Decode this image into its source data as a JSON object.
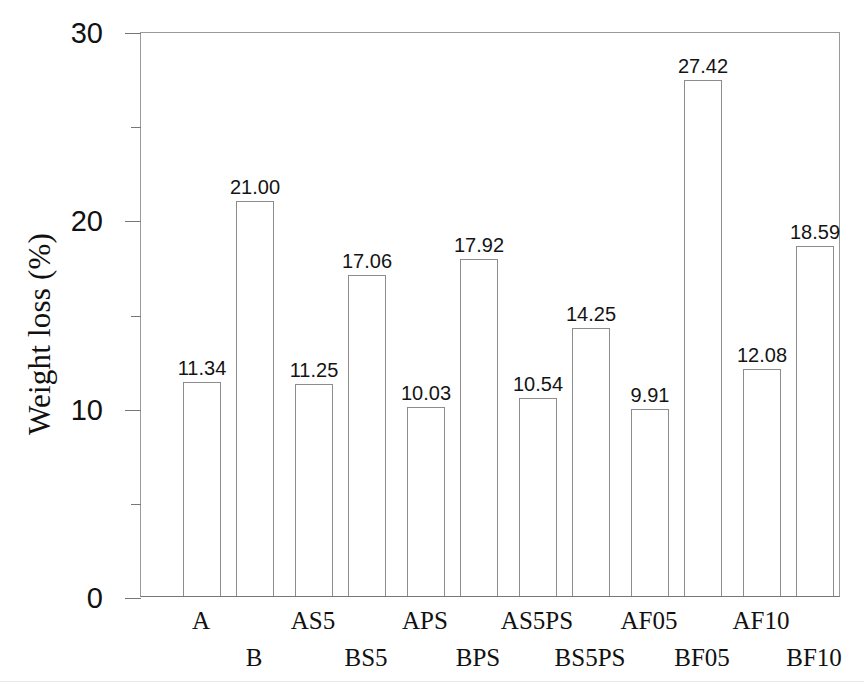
{
  "chart_data": {
    "type": "bar",
    "title": "",
    "xlabel": "",
    "ylabel": "Weight loss (%)",
    "ylim": [
      0,
      30
    ],
    "yticks": [
      0,
      10,
      20,
      30
    ],
    "ytick_labels": [
      "0",
      "10",
      "20",
      "30"
    ],
    "yminor_ticks": [
      5,
      15,
      25
    ],
    "grid": false,
    "legend": "none",
    "bar_style": "hollow-outline",
    "categories": [
      "A",
      "B",
      "AS5",
      "BS5",
      "APS",
      "BPS",
      "AS5PS",
      "BS5PS",
      "AF05",
      "BF05",
      "AF10",
      "BF10"
    ],
    "values": [
      11.34,
      21.0,
      11.25,
      17.06,
      10.03,
      17.92,
      10.54,
      14.25,
      9.91,
      27.42,
      12.08,
      18.59
    ],
    "value_labels": [
      "11.34",
      "21.00",
      "11.25",
      "17.06",
      "10.03",
      "17.92",
      "10.54",
      "14.25",
      "9.91",
      "27.42",
      "12.08",
      "18.59"
    ],
    "label_rows": [
      1,
      2,
      1,
      2,
      1,
      2,
      1,
      2,
      1,
      2,
      1,
      2
    ]
  },
  "axes": {
    "y_label": "Weight loss (%)",
    "y_tick_labels": [
      "30",
      "20",
      "10",
      "0"
    ]
  },
  "colors": {
    "background": "#ffffff",
    "axis": "#777777",
    "bar_outline": "#8c8c8c",
    "bar_fill": "#ffffff",
    "text": "#111111"
  }
}
